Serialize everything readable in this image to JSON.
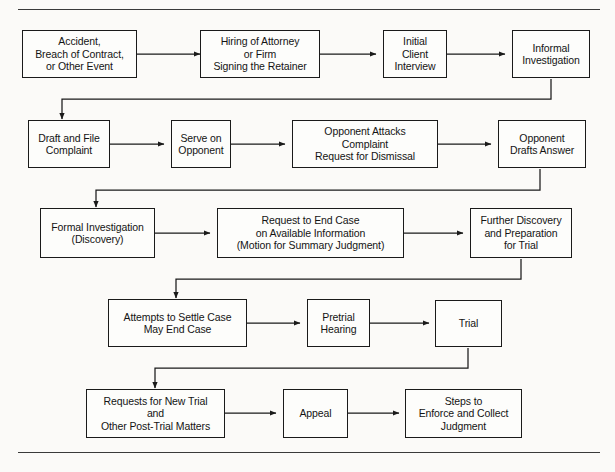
{
  "figure": {
    "caption_fragment": "",
    "top_rule": true,
    "bottom_rule": true
  },
  "diagram": {
    "type": "flowchart",
    "orientation": "serpentine-left-to-right",
    "nodes": [
      {
        "id": "n1",
        "row": 1,
        "col": 1,
        "label": "Accident,\nBreach of Contract,\nor Other Event"
      },
      {
        "id": "n2",
        "row": 1,
        "col": 2,
        "label": "Hiring of Attorney\nor Firm\nSigning the Retainer"
      },
      {
        "id": "n3",
        "row": 1,
        "col": 3,
        "label": "Initial\nClient\nInterview"
      },
      {
        "id": "n4",
        "row": 1,
        "col": 4,
        "label": "Informal\nInvestigation"
      },
      {
        "id": "n5",
        "row": 2,
        "col": 1,
        "label": "Draft and File\nComplaint"
      },
      {
        "id": "n6",
        "row": 2,
        "col": 2,
        "label": "Serve on\nOpponent"
      },
      {
        "id": "n7",
        "row": 2,
        "col": 3,
        "label": "Opponent Attacks\nComplaint\nRequest for Dismissal"
      },
      {
        "id": "n8",
        "row": 2,
        "col": 4,
        "label": "Opponent\nDrafts Answer"
      },
      {
        "id": "n9",
        "row": 3,
        "col": 1,
        "label": "Formal Investigation\n(Discovery)"
      },
      {
        "id": "n10",
        "row": 3,
        "col": 2,
        "label": "Request to End Case\non Available Information\n(Motion for Summary Judgment)"
      },
      {
        "id": "n11",
        "row": 3,
        "col": 3,
        "label": "Further Discovery\nand Preparation\nfor Trial"
      },
      {
        "id": "n12",
        "row": 4,
        "col": 1,
        "label": "Attempts to Settle Case\nMay End Case"
      },
      {
        "id": "n13",
        "row": 4,
        "col": 2,
        "label": "Pretrial\nHearing"
      },
      {
        "id": "n14",
        "row": 4,
        "col": 3,
        "label": "Trial"
      },
      {
        "id": "n15",
        "row": 5,
        "col": 1,
        "label": "Requests for New Trial\nand\nOther Post-Trial Matters"
      },
      {
        "id": "n16",
        "row": 5,
        "col": 2,
        "label": "Appeal"
      },
      {
        "id": "n17",
        "row": 5,
        "col": 3,
        "label": "Steps to\nEnforce and Collect\nJudgment"
      }
    ],
    "edges": [
      {
        "from": "n1",
        "to": "n2",
        "kind": "horizontal"
      },
      {
        "from": "n2",
        "to": "n3",
        "kind": "horizontal"
      },
      {
        "from": "n3",
        "to": "n4",
        "kind": "horizontal"
      },
      {
        "from": "n4",
        "to": "n5",
        "kind": "wrap-down-left"
      },
      {
        "from": "n5",
        "to": "n6",
        "kind": "horizontal"
      },
      {
        "from": "n6",
        "to": "n7",
        "kind": "horizontal"
      },
      {
        "from": "n7",
        "to": "n8",
        "kind": "horizontal"
      },
      {
        "from": "n8",
        "to": "n9",
        "kind": "wrap-down-left"
      },
      {
        "from": "n9",
        "to": "n10",
        "kind": "horizontal"
      },
      {
        "from": "n10",
        "to": "n11",
        "kind": "horizontal"
      },
      {
        "from": "n11",
        "to": "n12",
        "kind": "wrap-down-left"
      },
      {
        "from": "n12",
        "to": "n13",
        "kind": "horizontal"
      },
      {
        "from": "n13",
        "to": "n14",
        "kind": "horizontal"
      },
      {
        "from": "n14",
        "to": "n15",
        "kind": "wrap-down-left"
      },
      {
        "from": "n15",
        "to": "n16",
        "kind": "horizontal"
      },
      {
        "from": "n16",
        "to": "n17",
        "kind": "horizontal"
      }
    ],
    "colors": {
      "box_border": "#1a1a1a",
      "box_fill": "#fdfdfb",
      "connector": "#1a1a1a",
      "text": "#141414",
      "rule": "#3a3a3a",
      "page_background": "#fbfaf8"
    }
  }
}
